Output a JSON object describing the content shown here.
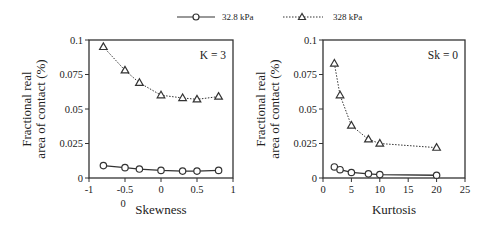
{
  "legend": {
    "items": [
      {
        "label": "32.8 kPa",
        "marker": "circle",
        "line": "solid"
      },
      {
        "label": "328 kPa",
        "marker": "triangle",
        "line": "dotted"
      }
    ]
  },
  "chart_data": [
    {
      "type": "line",
      "title": "",
      "annotation": "K = 3",
      "xlabel": "Skewness",
      "ylabel": "Fractional real area of contact (%)",
      "xlim": [
        -1,
        1
      ],
      "ylim": [
        0,
        0.1
      ],
      "xticks": [
        "-1",
        "-0.5",
        "0",
        "0.5",
        "1"
      ],
      "yticks": [
        "0",
        "0.025",
        "0.05",
        "0.075",
        "0.1"
      ],
      "extra_label": "0",
      "grid": false,
      "legend_position": "top",
      "series": [
        {
          "name": "32.8 kPa",
          "marker": "circle",
          "x": [
            -0.8,
            -0.5,
            -0.3,
            0,
            0.3,
            0.5,
            0.8
          ],
          "values": [
            0.009,
            0.0075,
            0.0065,
            0.0055,
            0.005,
            0.005,
            0.0055
          ]
        },
        {
          "name": "328 kPa",
          "marker": "triangle",
          "x": [
            -0.8,
            -0.5,
            -0.3,
            0,
            0.3,
            0.5,
            0.8
          ],
          "values": [
            0.095,
            0.078,
            0.069,
            0.06,
            0.058,
            0.057,
            0.059
          ]
        }
      ]
    },
    {
      "type": "line",
      "title": "",
      "annotation": "Sk = 0",
      "xlabel": "Kurtosis",
      "ylabel": "Fractional real area of contact (%)",
      "xlim": [
        0,
        25
      ],
      "ylim": [
        0,
        0.1
      ],
      "xticks": [
        "0",
        "5",
        "10",
        "15",
        "20",
        "25"
      ],
      "yticks": [
        "0",
        "0.025",
        "0.05",
        "0.075",
        "0.1"
      ],
      "grid": false,
      "legend_position": "top",
      "series": [
        {
          "name": "32.8 kPa",
          "marker": "circle",
          "x": [
            2,
            3,
            5,
            8,
            10,
            20
          ],
          "values": [
            0.008,
            0.006,
            0.004,
            0.003,
            0.0025,
            0.002
          ]
        },
        {
          "name": "328 kPa",
          "marker": "triangle",
          "x": [
            2,
            3,
            5,
            8,
            10,
            20
          ],
          "values": [
            0.083,
            0.06,
            0.038,
            0.028,
            0.025,
            0.022
          ]
        }
      ]
    }
  ],
  "layout": {
    "panels": [
      {
        "left": 89,
        "right": 233,
        "top": 40,
        "bottom": 178
      },
      {
        "left": 323,
        "right": 465,
        "top": 40,
        "bottom": 178
      }
    ],
    "colors": {
      "axis": "#333333",
      "series": "#333333"
    }
  }
}
